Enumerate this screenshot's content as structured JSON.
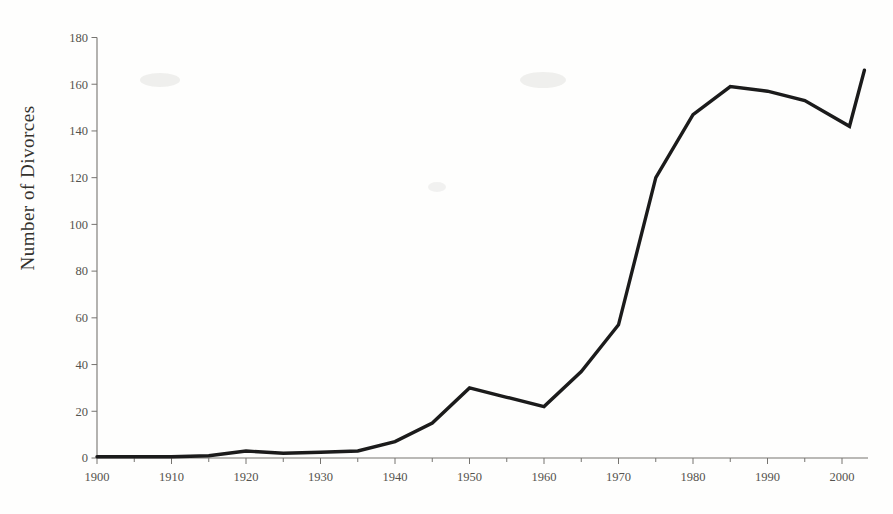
{
  "page": {
    "background": "#fefefd"
  },
  "chart_data": {
    "type": "line",
    "title": "",
    "xlabel": "",
    "ylabel": "Number of Divorces",
    "legend": "none",
    "grid": false,
    "xlim": [
      1900,
      2004
    ],
    "ylim": [
      0,
      180
    ],
    "y_ticks": [
      0,
      20,
      40,
      60,
      80,
      100,
      120,
      140,
      160,
      180
    ],
    "x_major_ticks": [
      1900,
      1910,
      1920,
      1930,
      1940,
      1950,
      1960,
      1970,
      1980,
      1990,
      2000
    ],
    "x_minor_ticks": [
      1905,
      1915,
      1925,
      1935,
      1945,
      1955,
      1965,
      1975,
      1985,
      1995
    ],
    "series": [
      {
        "name": "Number of Divorces",
        "points": [
          [
            1900,
            0.5
          ],
          [
            1905,
            0.5
          ],
          [
            1910,
            0.5
          ],
          [
            1915,
            1
          ],
          [
            1920,
            3
          ],
          [
            1925,
            2
          ],
          [
            1930,
            2.5
          ],
          [
            1935,
            3
          ],
          [
            1940,
            7
          ],
          [
            1945,
            15
          ],
          [
            1950,
            30
          ],
          [
            1955,
            26
          ],
          [
            1960,
            22
          ],
          [
            1965,
            37
          ],
          [
            1970,
            57
          ],
          [
            1975,
            120
          ],
          [
            1980,
            147
          ],
          [
            1985,
            159
          ],
          [
            1990,
            157
          ],
          [
            1995,
            153
          ],
          [
            2001,
            142
          ],
          [
            2003,
            166
          ]
        ]
      }
    ],
    "line_color": "#1b1b1b",
    "axis_color": "#767470",
    "tick_label_color": "#55534e",
    "ylabel_color": "#33312c"
  }
}
